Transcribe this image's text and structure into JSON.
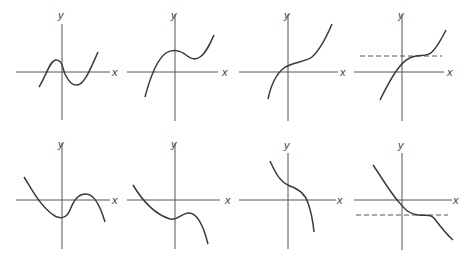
{
  "figure": {
    "axis_labels": {
      "x": "x",
      "y": "y"
    },
    "colors": {
      "curve": "#3a3a3a",
      "axis": "#555555"
    },
    "panels": [
      {
        "id": 1,
        "row": 1,
        "col": 1,
        "description": "cubic with local max left of origin, local min right, three real roots",
        "x_label": "x",
        "y_label": "y"
      },
      {
        "id": 2,
        "row": 1,
        "col": 2,
        "description": "cubic with local max on y-axis and local min right, one real root",
        "x_label": "x",
        "y_label": "y"
      },
      {
        "id": 3,
        "row": 1,
        "col": 3,
        "description": "increasing cubic with no turning points",
        "x_label": "x",
        "y_label": "y"
      },
      {
        "id": 4,
        "row": 1,
        "col": 4,
        "description": "increasing cubic with horizontal inflection, dashed horizontal tangent line",
        "x_label": "x",
        "y_label": "y"
      },
      {
        "id": 5,
        "row": 2,
        "col": 1,
        "description": "negative-leading cubic with local min and local max, three real roots",
        "x_label": "x",
        "y_label": "y"
      },
      {
        "id": 6,
        "row": 2,
        "col": 2,
        "description": "negative-leading cubic with local min and local max below axis, one real root",
        "x_label": "x",
        "y_label": "y"
      },
      {
        "id": 7,
        "row": 2,
        "col": 3,
        "description": "decreasing cubic with no turning points",
        "x_label": "x",
        "y_label": "y"
      },
      {
        "id": 8,
        "row": 2,
        "col": 4,
        "description": "decreasing cubic with horizontal inflection, dashed horizontal tangent line",
        "x_label": "x",
        "y_label": "y"
      }
    ]
  }
}
